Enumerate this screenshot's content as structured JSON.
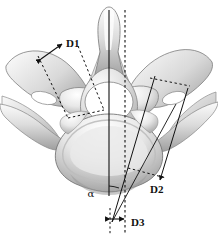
{
  "figure": {
    "background_color": "#ffffff",
    "line_color": "#111111",
    "bone_fill_light": "#f2f2f2",
    "bone_fill_mid": "#d8d8d8",
    "bone_fill_dark": "#b3b3b3",
    "bone_outline": "#6e6e6e",
    "foramen_fill": "#ffffff"
  },
  "annotations": {
    "labels": [
      {
        "id": "d1",
        "text": "D1",
        "x": 66,
        "y": 47
      },
      {
        "id": "d2",
        "text": "D2",
        "x": 150,
        "y": 193
      },
      {
        "id": "d3",
        "text": "D3",
        "x": 131,
        "y": 226
      },
      {
        "id": "alpha",
        "text": "α",
        "x": 91,
        "y": 197
      }
    ]
  },
  "structures": {
    "spinous_process": "spinous-process",
    "vertebral_foramen": "vertebral-foramen",
    "vertebral_body": "vertebral-body",
    "left_transverse_process": "left-transverse-process",
    "right_transverse_process": "right-transverse-process"
  }
}
